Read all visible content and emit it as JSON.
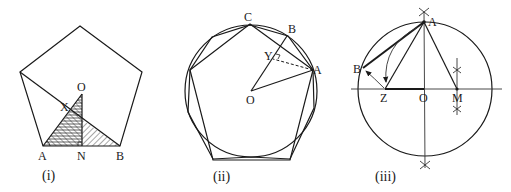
{
  "figures": {
    "fig1": {
      "caption": "(i)",
      "labels": {
        "O": "O",
        "X": "X",
        "A": "A",
        "N": "N",
        "B": "B"
      },
      "description": "Regular pentagon with hatched triangles AOB region, altitude ON, point X"
    },
    "fig2": {
      "caption": "(ii)",
      "labels": {
        "C": "C",
        "B": "B",
        "Y": "Y",
        "A": "A",
        "O": "O"
      },
      "description": "Circle with inscribed regular pentagon and decagon; OB, OA radii, AY dashed perpendicular"
    },
    "fig3": {
      "caption": "(iii)",
      "labels": {
        "A": "A",
        "B": "B",
        "Z": "Z",
        "O": "O",
        "M": "M"
      },
      "description": "Circle construction of pentagon side: M midpoint, arc AZ, chord AB"
    }
  }
}
